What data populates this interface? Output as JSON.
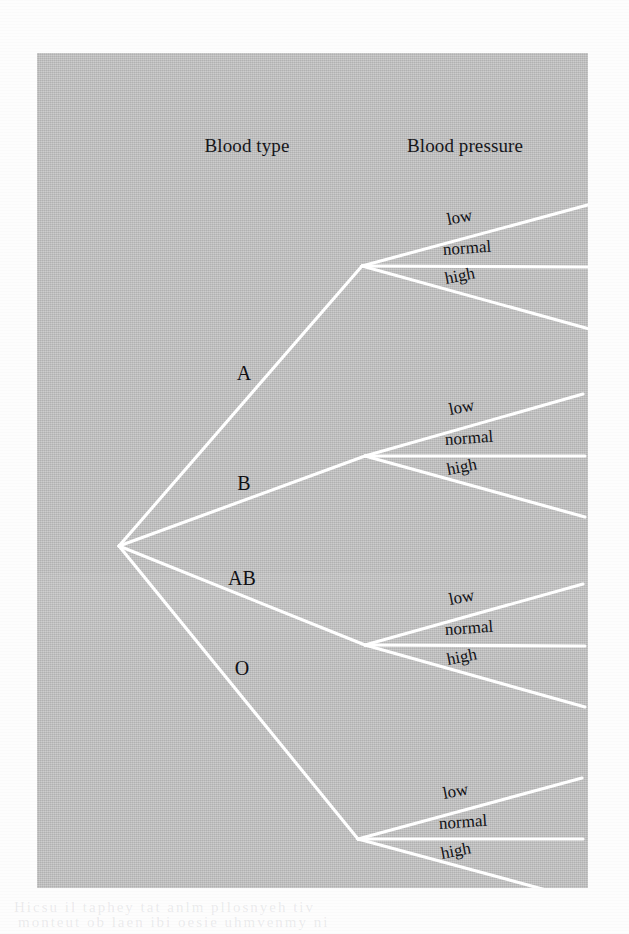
{
  "figure": {
    "type": "probability-tree-diagram",
    "background_color": "#c3c3c3",
    "branch_color": "#ffffff",
    "text_color": "#101014",
    "headers": [
      {
        "id": "blood-type",
        "label": "Blood type",
        "cx": 210,
        "y": 82
      },
      {
        "id": "blood-pressure",
        "label": "Blood pressure",
        "cx": 428,
        "y": 82
      }
    ],
    "root": {
      "x": 82,
      "y": 493
    },
    "level1": [
      {
        "id": "a",
        "label": "A",
        "label_x": 207,
        "label_y": 320,
        "node_x": 325,
        "node_y": 213,
        "children": [
          {
            "id": "a-low",
            "label": "low",
            "end_x": 558,
            "end_y": 150,
            "label_x": 410,
            "label_y": 167,
            "rotate": -11
          },
          {
            "id": "a-normal",
            "label": "normal",
            "end_x": 556,
            "end_y": 214,
            "label_x": 406,
            "label_y": 197,
            "rotate": -4
          },
          {
            "id": "a-high",
            "label": "high",
            "end_x": 556,
            "end_y": 277,
            "label_x": 408,
            "label_y": 226,
            "rotate": -11
          }
        ]
      },
      {
        "id": "b",
        "label": "B",
        "label_x": 207,
        "label_y": 430,
        "node_x": 328,
        "node_y": 403,
        "children": [
          {
            "id": "b-low",
            "label": "low",
            "end_x": 546,
            "end_y": 341,
            "label_x": 412,
            "label_y": 357,
            "rotate": -11
          },
          {
            "id": "b-normal",
            "label": "normal",
            "end_x": 548,
            "end_y": 403,
            "label_x": 408,
            "label_y": 387,
            "rotate": -4
          },
          {
            "id": "b-high",
            "label": "high",
            "end_x": 548,
            "end_y": 464,
            "label_x": 410,
            "label_y": 417,
            "rotate": -11
          }
        ]
      },
      {
        "id": "ab",
        "label": "AB",
        "label_x": 205,
        "label_y": 525,
        "node_x": 328,
        "node_y": 592,
        "children": [
          {
            "id": "ab-low",
            "label": "low",
            "end_x": 546,
            "end_y": 531,
            "label_x": 412,
            "label_y": 547,
            "rotate": -11
          },
          {
            "id": "ab-normal",
            "label": "normal",
            "end_x": 548,
            "end_y": 593,
            "label_x": 408,
            "label_y": 577,
            "rotate": -4
          },
          {
            "id": "ab-high",
            "label": "high",
            "end_x": 548,
            "end_y": 654,
            "label_x": 410,
            "label_y": 607,
            "rotate": -11
          }
        ]
      },
      {
        "id": "o",
        "label": "O",
        "label_x": 205,
        "label_y": 615,
        "node_x": 321,
        "node_y": 786,
        "children": [
          {
            "id": "o-low",
            "label": "low",
            "end_x": 545,
            "end_y": 725,
            "label_x": 406,
            "label_y": 741,
            "rotate": -11
          },
          {
            "id": "o-normal",
            "label": "normal",
            "end_x": 546,
            "end_y": 786,
            "label_x": 402,
            "label_y": 771,
            "rotate": -4
          },
          {
            "id": "o-high",
            "label": "high",
            "end_x": 546,
            "end_y": 847,
            "label_x": 404,
            "label_y": 801,
            "rotate": -11
          }
        ]
      }
    ],
    "bleed_text": [
      {
        "text": "Hicsu  il  taphey  tat  anlm  pllosnyeh  tiv",
        "x": 14,
        "y": 899
      },
      {
        "text": "monteut  ob  laen  ibi  oesie  uhmvenmy  ni",
        "x": 18,
        "y": 914
      }
    ]
  }
}
